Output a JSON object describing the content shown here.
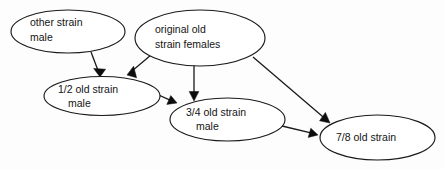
{
  "diagram": {
    "background_color": "#fdfdfd",
    "stroke_color": "#1a1a1a",
    "text_color": "#141414",
    "nodes": [
      {
        "id": "other-strain-male",
        "line1": "other strain",
        "line2": "male",
        "cx": 68,
        "cy": 31.5,
        "rx": 57,
        "ry": 21.5
      },
      {
        "id": "original-old-strain-females",
        "line1": "original old",
        "line2": "strain females",
        "cx": 200,
        "cy": 38,
        "rx": 65,
        "ry": 28
      },
      {
        "id": "half-old-strain-male",
        "line1": "1/2 old strain",
        "line2": "male",
        "cx": 102,
        "cy": 96,
        "rx": 58,
        "ry": 19.5
      },
      {
        "id": "three-quarter-old-strain-male",
        "line1": "3/4 old strain",
        "line2": "male",
        "cx": 227.5,
        "cy": 119.5,
        "rx": 57.5,
        "ry": 21.5
      },
      {
        "id": "seven-eighth-old-strain",
        "line1": "7/8 old strain",
        "line2": "",
        "cx": 377.5,
        "cy": 137.5,
        "rx": 57.5,
        "ry": 22.5
      }
    ],
    "edges": [
      {
        "id": "edge-other-male-to-half",
        "from": "other-strain-male",
        "to": "half-old-strain-male",
        "x1": 91,
        "y1": 52,
        "x2": 100,
        "y2": 76
      },
      {
        "id": "edge-original-females-to-half",
        "from": "original-old-strain-females",
        "to": "half-old-strain-male",
        "x1": 151,
        "y1": 55,
        "x2": 127,
        "y2": 75
      },
      {
        "id": "edge-original-females-to-three-quarter",
        "from": "original-old-strain-females",
        "to": "three-quarter-old-strain-male",
        "x1": 194,
        "y1": 63,
        "x2": 194,
        "y2": 101
      },
      {
        "id": "edge-half-to-three-quarter",
        "from": "half-old-strain-male",
        "to": "three-quarter-old-strain-male",
        "x1": 152,
        "y1": 92,
        "x2": 177,
        "y2": 103
      },
      {
        "id": "edge-original-females-to-seven-eighth",
        "from": "original-old-strain-females",
        "to": "seven-eighth-old-strain",
        "x1": 253,
        "y1": 57,
        "x2": 330,
        "y2": 123
      },
      {
        "id": "edge-three-quarter-to-seven-eighth",
        "from": "three-quarter-old-strain-male",
        "to": "seven-eighth-old-strain",
        "x1": 282,
        "y1": 126,
        "x2": 318,
        "y2": 135
      }
    ]
  }
}
